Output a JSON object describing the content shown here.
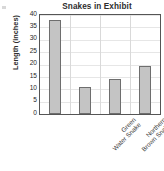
{
  "chart_data": {
    "type": "bar",
    "title": "Snakes in Exhibit",
    "xlabel": "",
    "ylabel": "Length (inches)",
    "categories": [
      "Green Water Snake",
      "Northern Brown Snake",
      "Southern Ringneck Snake",
      "Checkered Garter Snake"
    ],
    "category_lines": [
      [
        "Green",
        "Water Snake"
      ],
      [
        "Northern",
        "Brown Snake"
      ],
      [
        "Southern",
        "Ringneck Snake"
      ],
      [
        "Checkered",
        "Garter Snake"
      ]
    ],
    "values": [
      38,
      11,
      14,
      19.5
    ],
    "ylim": [
      0,
      40
    ],
    "yticks": [
      0,
      5,
      10,
      15,
      20,
      25,
      30,
      35,
      40
    ],
    "ytick_labels": [
      "0",
      "5",
      "10",
      "15",
      "20",
      "25",
      "30",
      "35",
      "40"
    ],
    "grid": true,
    "legend": false,
    "bar_color": "#c4c4c4",
    "bar_border_color": "#6e6e6e",
    "axis_color": "#555555",
    "gridline_color": "#e6e6e6",
    "text_color": "#2e2e2e"
  }
}
